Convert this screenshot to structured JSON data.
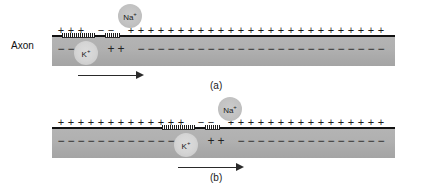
{
  "figure": {
    "axon_label": "Axon",
    "ion_sodium": "Na",
    "ion_sodium_charge": "+",
    "ion_potassium": "K",
    "ion_potassium_charge": "+",
    "plus_symbol": "+",
    "minus_symbol": "−",
    "dash_symbol": "−",
    "colors": {
      "axon_fill": "#b0b0b0",
      "membrane": "#111111",
      "text": "#1a1a1a",
      "ion_sodium_fill": "#c2c2c2",
      "ion_potassium_fill": "#d5d5d5",
      "background": "#ffffff"
    },
    "panels": [
      {
        "id": "a",
        "caption": "(a)",
        "outer_charges": [
          "+",
          "+",
          "+",
          "",
          "−",
          "−",
          "",
          "+",
          "+",
          "+",
          "+",
          "+",
          "+",
          "+",
          "+",
          "+",
          "+",
          "+",
          "+",
          "+",
          "+",
          "+",
          "+",
          "+",
          "+",
          "+",
          "+",
          "+",
          "+",
          "+",
          "+",
          "+",
          "+"
        ],
        "inner_charges": [
          "−",
          "−",
          "−",
          "",
          "",
          "+",
          "+",
          "",
          "−",
          "−",
          "−",
          "−",
          "−",
          "−",
          "−",
          "−",
          "−",
          "−",
          "−",
          "−",
          "−",
          "−",
          "−",
          "−",
          "−",
          "−",
          "−",
          "−",
          "−",
          "−",
          "−",
          "−",
          "−"
        ],
        "active_zone_label": "depolarized region",
        "arrow_direction": "right",
        "arrow_label": "propagation direction"
      },
      {
        "id": "b",
        "caption": "(b)",
        "outer_charges": [
          "+",
          "+",
          "+",
          "+",
          "+",
          "+",
          "+",
          "+",
          "+",
          "+",
          "+",
          "+",
          "+",
          "",
          "−",
          "−",
          "",
          "+",
          "+",
          "+",
          "+",
          "+",
          "+",
          "+",
          "+",
          "+",
          "+",
          "+",
          "+",
          "+",
          "+",
          "+",
          "+"
        ],
        "inner_charges": [
          "−",
          "−",
          "−",
          "−",
          "−",
          "−",
          "−",
          "−",
          "−",
          "−",
          "−",
          "−",
          "−",
          "",
          "",
          "+",
          "+",
          "",
          "−",
          "−",
          "−",
          "−",
          "−",
          "−",
          "−",
          "−",
          "−",
          "−",
          "−",
          "−",
          "−",
          "−",
          "−"
        ],
        "active_zone_label": "depolarized region",
        "arrow_direction": "right",
        "arrow_label": "propagation direction"
      }
    ]
  }
}
